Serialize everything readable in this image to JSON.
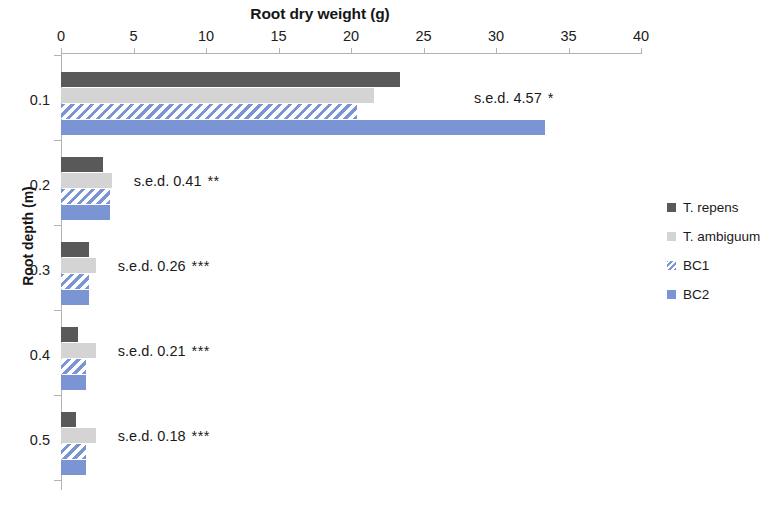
{
  "chart_data": {
    "type": "bar",
    "orientation": "horizontal",
    "title": "Root dry weight (g)",
    "xlabel": "Root dry weight (g)",
    "ylabel": "Root depth (m)",
    "xlim": [
      0,
      40
    ],
    "ylim_categories": [
      "0.1",
      "0.2",
      "0.3",
      "0.4",
      "0.5"
    ],
    "xticks": [
      0,
      5,
      10,
      15,
      20,
      25,
      30,
      35,
      40
    ],
    "xtick_labels": [
      "0",
      "5",
      "10",
      "15",
      "20",
      "25",
      "30",
      "35",
      "40"
    ],
    "ytick_labels": [
      "0.1",
      "0.2",
      "0.3",
      "0.4",
      "0.5"
    ],
    "categories": [
      "0.1",
      "0.2",
      "0.3",
      "0.4",
      "0.5"
    ],
    "grid": false,
    "legend_position": "right",
    "series": [
      {
        "name": "T. repens",
        "color": "#595959",
        "pattern": "solid",
        "values": [
          23.4,
          2.9,
          1.9,
          1.2,
          1.0
        ]
      },
      {
        "name": "T. ambiguum",
        "color": "#d4d4d4",
        "pattern": "solid",
        "values": [
          21.6,
          3.5,
          2.4,
          2.4,
          2.4
        ]
      },
      {
        "name": "BC1",
        "color": "#7b95d4",
        "pattern": "hatch",
        "values": [
          20.4,
          3.4,
          1.9,
          1.7,
          1.7
        ]
      },
      {
        "name": "BC2",
        "color": "#7b95d4",
        "pattern": "solid",
        "values": [
          33.4,
          3.4,
          1.9,
          1.7,
          1.7
        ]
      }
    ],
    "annotations": [
      {
        "category": "0.1",
        "label": "s.e.d. 4.57",
        "significance": "*",
        "sed": 4.57
      },
      {
        "category": "0.2",
        "label": "s.e.d. 0.41",
        "significance": "**",
        "sed": 0.41
      },
      {
        "category": "0.3",
        "label": "s.e.d. 0.26",
        "significance": "***",
        "sed": 0.26
      },
      {
        "category": "0.4",
        "label": "s.e.d. 0.21",
        "significance": "***",
        "sed": 0.21
      },
      {
        "category": "0.5",
        "label": "s.e.d. 0.18",
        "significance": "***",
        "sed": 0.18
      }
    ]
  },
  "legend": {
    "items": [
      {
        "label": "T. repens"
      },
      {
        "label": "T. ambiguum"
      },
      {
        "label": "BC1"
      },
      {
        "label": "BC2"
      }
    ]
  },
  "axis": {
    "x_title": "Root dry weight (g)",
    "y_title": "Root depth (m)"
  }
}
